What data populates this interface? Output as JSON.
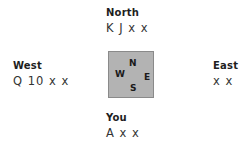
{
  "seats": {
    "north": {
      "name": "North",
      "hand": "K J x x"
    },
    "west": {
      "name": "West",
      "hand": "Q 10 x x"
    },
    "east": {
      "name": "East",
      "hand": "x x"
    },
    "south": {
      "name": "You",
      "hand": "A x x"
    }
  },
  "table": {
    "fill_color": "#b3b3b3",
    "directions": {
      "n": "N",
      "w": "W",
      "e": "E",
      "s": "S"
    }
  }
}
